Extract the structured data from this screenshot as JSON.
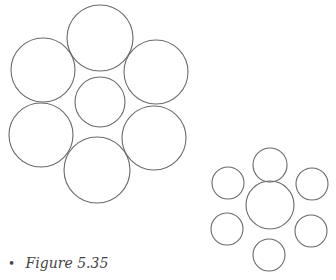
{
  "figure": {
    "caption": "Figure 5.35",
    "bullet": "•",
    "stroke_color": "#6a6a6a",
    "clusters": [
      {
        "name": "large-outer-cluster",
        "description": "Six large circles surrounding one smaller central circle",
        "outer_count": 6,
        "relative_size": "outer circles larger than center"
      },
      {
        "name": "small-outer-cluster",
        "description": "Six small circles surrounding one larger central circle",
        "outer_count": 6,
        "relative_size": "outer circles smaller than center"
      }
    ]
  }
}
